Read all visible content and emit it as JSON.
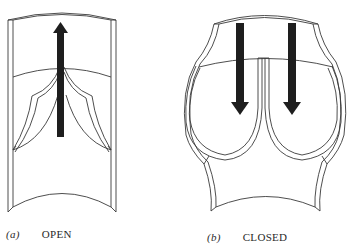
{
  "figure": {
    "panels": [
      {
        "tag": "(a)",
        "label": "OPEN",
        "arrow_direction": "up",
        "arrow_count": 1
      },
      {
        "tag": "(b)",
        "label": "CLOSED",
        "arrow_direction": "down",
        "arrow_count": 2
      }
    ],
    "colors": {
      "line": "#3a3a3a",
      "arrow": "#1e1e1e",
      "background": "#ffffff"
    }
  }
}
